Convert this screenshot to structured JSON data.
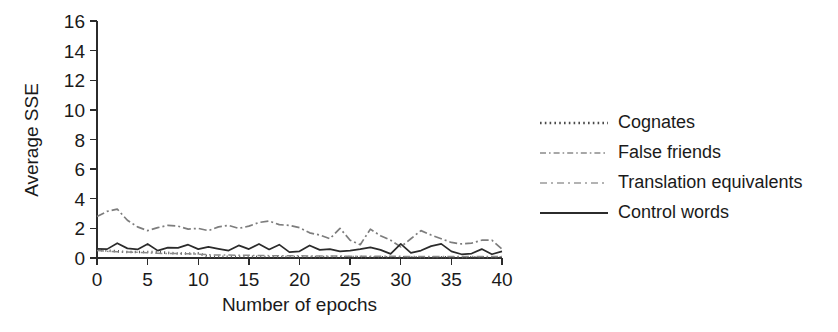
{
  "chart_data": {
    "type": "line",
    "title": "",
    "xlabel": "Number of epochs",
    "ylabel": "Average SSE",
    "xlim": [
      0,
      40
    ],
    "ylim": [
      0,
      16
    ],
    "xticks": [
      0,
      5,
      10,
      15,
      20,
      25,
      30,
      35,
      40
    ],
    "yticks": [
      0,
      2,
      4,
      6,
      8,
      10,
      12,
      14,
      16
    ],
    "xtick_labels": [
      "0",
      "5",
      "10",
      "15",
      "20",
      "25",
      "30",
      "35",
      "40"
    ],
    "ytick_labels": [
      "0",
      "2",
      "4",
      "6",
      "8",
      "10",
      "12",
      "14",
      "16"
    ],
    "grid": false,
    "legend_position": "right",
    "x": [
      0,
      1,
      2,
      3,
      4,
      5,
      6,
      7,
      8,
      9,
      10,
      11,
      12,
      13,
      14,
      15,
      16,
      17,
      18,
      19,
      20,
      21,
      22,
      23,
      24,
      25,
      26,
      27,
      28,
      29,
      30,
      31,
      32,
      33,
      34,
      35,
      36,
      37,
      38,
      39,
      40
    ],
    "series": [
      {
        "name": "Cognates",
        "style": "dotted",
        "color": "#4a4a4a",
        "width": 2.6,
        "dash": "1,3.2",
        "values": [
          0.55,
          0.5,
          0.45,
          0.4,
          0.4,
          0.4,
          0.4,
          0.35,
          0.3,
          0.3,
          0.3,
          0.1,
          0.08,
          0.08,
          0.08,
          0.08,
          0.07,
          0.07,
          0.07,
          0.07,
          0.07,
          0.06,
          0.06,
          0.06,
          0.06,
          0.06,
          0.06,
          0.05,
          0.05,
          0.05,
          0.05,
          0.05,
          0.05,
          0.05,
          0.05,
          0.05,
          0.05,
          0.05,
          0.05,
          0.05,
          0.05
        ]
      },
      {
        "name": "False friends",
        "style": "dash-dot",
        "color": "#8a8a8a",
        "width": 1.5,
        "dash": "7,3,1.6,3",
        "values": [
          0.5,
          0.45,
          0.42,
          0.4,
          0.38,
          0.35,
          0.32,
          0.3,
          0.3,
          0.28,
          0.26,
          0.22,
          0.2,
          0.2,
          0.18,
          0.18,
          0.17,
          0.16,
          0.16,
          0.15,
          0.15,
          0.14,
          0.14,
          0.13,
          0.13,
          0.12,
          0.12,
          0.12,
          0.11,
          0.11,
          0.11,
          0.1,
          0.1,
          0.1,
          0.1,
          0.1,
          0.1,
          0.1,
          0.1,
          0.1,
          0.1
        ]
      },
      {
        "name": "Translation equivalents",
        "style": "dash-dot",
        "color": "#7d7d7d",
        "width": 1.7,
        "dash": "8,3,2,3",
        "values": [
          2.8,
          3.15,
          3.3,
          2.55,
          2.1,
          1.85,
          2.05,
          2.2,
          2.15,
          1.95,
          2.0,
          1.85,
          2.1,
          2.2,
          2.0,
          2.15,
          2.4,
          2.5,
          2.25,
          2.2,
          2.05,
          1.7,
          1.55,
          1.3,
          2.0,
          1.2,
          0.9,
          1.95,
          1.5,
          1.2,
          0.75,
          1.3,
          1.85,
          1.55,
          1.3,
          1.05,
          0.95,
          1.0,
          1.2,
          1.2,
          0.6
        ]
      },
      {
        "name": "Control words",
        "style": "solid",
        "color": "#2b2b2b",
        "width": 1.7,
        "dash": "",
        "values": [
          0.62,
          0.6,
          1.0,
          0.65,
          0.58,
          0.95,
          0.5,
          0.7,
          0.68,
          0.9,
          0.6,
          0.75,
          0.62,
          0.5,
          0.85,
          0.6,
          0.95,
          0.58,
          0.9,
          0.4,
          0.45,
          0.85,
          0.55,
          0.6,
          0.45,
          0.5,
          0.6,
          0.72,
          0.55,
          0.28,
          0.95,
          0.35,
          0.5,
          0.8,
          0.95,
          0.45,
          0.25,
          0.3,
          0.6,
          0.25,
          0.45
        ]
      }
    ],
    "legend": [
      {
        "label": "Cognates",
        "style": "dotted",
        "color": "#4a4a4a",
        "width": 2.6,
        "dash": "1.6,3.2"
      },
      {
        "label": "False friends",
        "style": "dash-dot",
        "color": "#8a8a8a",
        "width": 1.5,
        "dash": "6,3,1.6,3"
      },
      {
        "label": "Translation equivalents",
        "style": "dash-dot",
        "color": "#9a9a9a",
        "width": 1.5,
        "dash": "7,4,2,4"
      },
      {
        "label": "Control words",
        "style": "solid",
        "color": "#2b2b2b",
        "width": 1.8,
        "dash": ""
      }
    ]
  },
  "colors": {
    "background": "#ffffff",
    "axis": "#2b2b2b",
    "text": "#1a1a1a"
  }
}
